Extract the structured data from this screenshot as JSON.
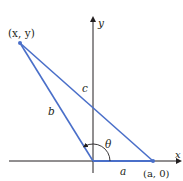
{
  "diagram": {
    "colors": {
      "triangle": "#4a6fc9",
      "axes": "#231f20",
      "text": "#231f20",
      "background": "#ffffff"
    },
    "axes": {
      "x_label": "x",
      "y_label": "y"
    },
    "points": {
      "p": {
        "label": "(x, y)"
      },
      "a": {
        "label": "(a, 0)"
      }
    },
    "sides": {
      "a": "a",
      "b": "b",
      "c": "c"
    },
    "angle": {
      "label": "θ"
    }
  }
}
